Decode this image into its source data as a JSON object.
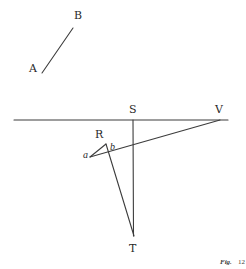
{
  "figure": {
    "caption_prefix": "Fig.",
    "caption_number": "12",
    "line_color": "#3c3c3c",
    "text_color": "#2a2a2a",
    "labels": {
      "A": "A",
      "B": "B",
      "S": "S",
      "V": "V",
      "R": "R",
      "a": "a",
      "b": "b",
      "T": "T"
    },
    "points": {
      "A": [
        42,
        73
      ],
      "B": [
        73,
        28
      ],
      "horizon_left": [
        14,
        120
      ],
      "horizon_right": [
        228,
        120
      ],
      "S": [
        133,
        120
      ],
      "V": [
        220,
        120
      ],
      "R": [
        106,
        144
      ],
      "a": [
        90,
        157
      ],
      "T": [
        134,
        236
      ]
    },
    "segments": [
      [
        "A",
        "B"
      ],
      [
        "horizon_left",
        "horizon_right"
      ],
      [
        "S",
        "T"
      ],
      [
        "V",
        "a"
      ],
      [
        "R",
        "a"
      ],
      [
        "R",
        "T"
      ]
    ]
  }
}
